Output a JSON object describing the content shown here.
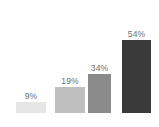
{
  "chart_data": {
    "type": "bar",
    "title": "",
    "subtitle": "",
    "xlabel": "",
    "ylabel": "",
    "categories": [
      "",
      "",
      "",
      ""
    ],
    "values": [
      9,
      19,
      34,
      54
    ],
    "value_labels": [
      "9%",
      "19%",
      "34%",
      "54%"
    ],
    "ylim": [
      0,
      62
    ],
    "grid": false,
    "legend": false,
    "axis_lines": false,
    "tick_labels": [],
    "bar_colors": [
      "#e6e6e6",
      "#bfbfbf",
      "#8a8a8a",
      "#3a3a3a"
    ],
    "label_color": "#6e6e6e",
    "background_color": "#ffffff",
    "bars": [
      {
        "label": "9%",
        "value": 9,
        "color": "#e6e6e6",
        "left": 16,
        "width": 30,
        "height": 11
      },
      {
        "label": "19%",
        "value": 19,
        "color": "#bfbfbf",
        "left": 55,
        "width": 30,
        "height": 26
      },
      {
        "label": "34%",
        "value": 34,
        "color": "#8a8a8a",
        "left": 88,
        "width": 23,
        "height": 39
      },
      {
        "label": "54%",
        "value": 54,
        "color": "#3a3a3a",
        "left": 122,
        "width": 29,
        "height": 73
      }
    ]
  }
}
